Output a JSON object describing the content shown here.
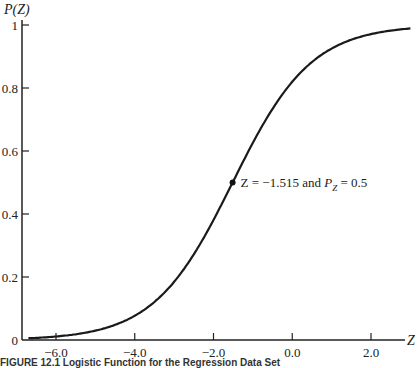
{
  "chart_data": {
    "type": "line",
    "title": "",
    "xlabel": "Z",
    "ylabel": "P(Z)",
    "xlim": [
      -6.7,
      3.0
    ],
    "ylim": [
      0,
      1
    ],
    "x_ticks": [
      -6.0,
      -4.0,
      -2.0,
      0.0,
      2.0
    ],
    "x_tick_labels": [
      "-6.0",
      "-4.0",
      "-2.0",
      "0.0",
      "2.0"
    ],
    "y_ticks": [
      0,
      0.2,
      0.4,
      0.6,
      0.8,
      1
    ],
    "y_tick_labels": [
      "0",
      "0.2",
      "0.4",
      "0.6",
      "0.8",
      "1"
    ],
    "grid": false,
    "series": [
      {
        "name": "logistic",
        "function": "1/(1+exp(-(Z+1.515)))",
        "x": [
          -6.7,
          -6.0,
          -5.0,
          -4.0,
          -3.0,
          -2.0,
          -1.515,
          -1.0,
          0.0,
          1.0,
          2.0,
          3.0
        ],
        "values": [
          0.006,
          0.011,
          0.03,
          0.077,
          0.185,
          0.381,
          0.5,
          0.626,
          0.82,
          0.925,
          0.971,
          0.989
        ]
      }
    ],
    "annotations": [
      {
        "x": -1.515,
        "y": 0.5,
        "text_parts": [
          "Z = −1.515 and ",
          "P",
          "Z",
          " = 0.5"
        ]
      }
    ],
    "caption": "FIGURE 12.1 Logistic Function for the Regression Data Set"
  }
}
